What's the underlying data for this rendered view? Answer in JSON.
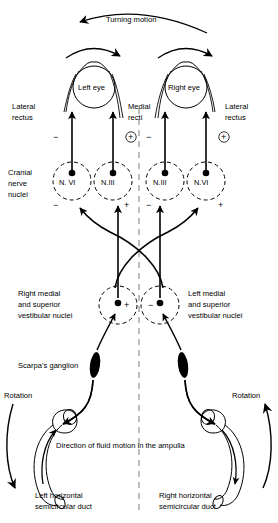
{
  "figure": {
    "midline_label": "midline"
  },
  "labels": {
    "turning_motion": "Turning motion",
    "left_eye": "Left eye",
    "right_eye": "Right eye",
    "lateral_rectus_left": "Lateral\nrectus",
    "lateral_rectus_left_line1": "Lateral",
    "lateral_rectus_left_line2": "rectus",
    "medial_recti_line1": "Medial",
    "medial_recti_line2": "recti",
    "lateral_rectus_right_line1": "Lateral",
    "lateral_rectus_right_line2": "rectus",
    "cranial_line1": "Cranial",
    "cranial_line2": "nerve",
    "cranial_line3": "nuclei",
    "right_vest_line1": "Right medial",
    "right_vest_line2": "and superior",
    "right_vest_line3": "vestibular nuclei",
    "left_vest_line1": "Left medial",
    "left_vest_line2": "and superior",
    "left_vest_line3": "vestibular nuclei",
    "scarpas_ganglion": "Scarpa's ganglion",
    "rotation_left": "Rotation",
    "rotation_right": "Rotation",
    "fluid_direction": "Direction of fluid motion in the ampulla",
    "left_duct_line1": "Left horizontal",
    "left_duct_line2": "semicircular duct",
    "right_duct_line1": "Right horizontal",
    "right_duct_line2": "semicircular duct"
  },
  "nuclei": [
    {
      "id": "n6-left",
      "name": "N. VI",
      "cx": 72,
      "cy": 181,
      "sign_left": "−",
      "sign_right": ""
    },
    {
      "id": "n3-left",
      "name": "N.III",
      "cx": 113,
      "cy": 181,
      "sign_left": "",
      "sign_right": "+"
    },
    {
      "id": "n3-right",
      "name": "N.III",
      "cx": 165,
      "cy": 181,
      "sign_left": "−",
      "sign_right": ""
    },
    {
      "id": "n6-right",
      "name": "N.VI",
      "cx": 206,
      "cy": 181,
      "sign_left": "",
      "sign_right": "+"
    }
  ],
  "vestibular_nuclei": [
    {
      "id": "vest-right",
      "cx": 118,
      "cy": 305,
      "sign": "+"
    },
    {
      "id": "vest-left",
      "cx": 160,
      "cy": 305,
      "sign": "−"
    }
  ],
  "muscle_signs": {
    "left_lateral_rectus": "−",
    "left_medial_rectus": "+",
    "right_medial_rectus": "−",
    "right_lateral_rectus": "+"
  },
  "colors": {
    "ink": "#000000",
    "paper": "#ffffff"
  }
}
